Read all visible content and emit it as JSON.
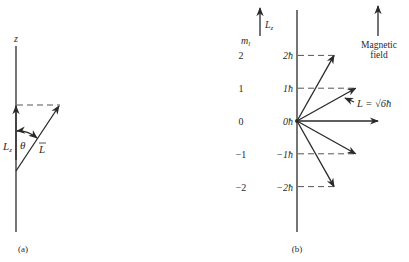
{
  "panel_a": {
    "caption": "(a)",
    "axis_label": "z",
    "lz_label": "L",
    "lz_sub": "z",
    "theta_label": "θ",
    "vector_label": "L"
  },
  "panel_b": {
    "caption": "(b)",
    "ml_label": "m",
    "ml_sub": "l",
    "lz_label": "L",
    "lz_sub": "z",
    "field_label_line1": "Magnetic",
    "field_label_line2": "field",
    "magnitude_label": "L = √6ħ",
    "levels": [
      {
        "ml": "2",
        "lz": "2ħ",
        "value": 2
      },
      {
        "ml": "1",
        "lz": "1ħ",
        "value": 1
      },
      {
        "ml": "0",
        "lz": "0ħ",
        "value": 0
      },
      {
        "ml": "−1",
        "lz": "−1ħ",
        "value": -1
      },
      {
        "ml": "−2",
        "lz": "−2ħ",
        "value": -2
      }
    ]
  }
}
